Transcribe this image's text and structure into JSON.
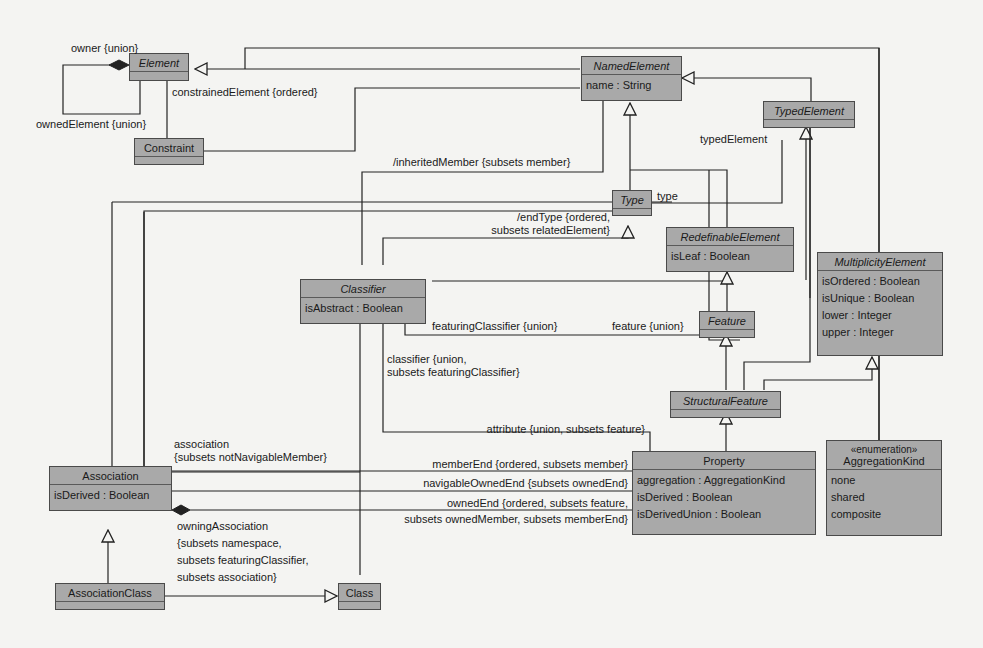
{
  "diagram": {
    "classes": {
      "element": {
        "name": "Element",
        "abstract": true
      },
      "constraint": {
        "name": "Constraint"
      },
      "named_element": {
        "name": "NamedElement",
        "abstract": true,
        "attributes": [
          "name : String"
        ]
      },
      "typed_element": {
        "name": "TypedElement",
        "abstract": true
      },
      "type": {
        "name": "Type",
        "abstract": true
      },
      "redefinable_element": {
        "name": "RedefinableElement",
        "abstract": true,
        "attributes": [
          "isLeaf : Boolean"
        ]
      },
      "multiplicity_element": {
        "name": "MultiplicityElement",
        "abstract": true,
        "attributes": [
          "isOrdered : Boolean",
          "isUnique : Boolean",
          "lower : Integer",
          "upper : Integer"
        ]
      },
      "classifier": {
        "name": "Classifier",
        "abstract": true,
        "attributes": [
          "isAbstract : Boolean"
        ]
      },
      "feature": {
        "name": "Feature",
        "abstract": true
      },
      "structural_feature": {
        "name": "StructuralFeature",
        "abstract": true
      },
      "association": {
        "name": "Association",
        "attributes": [
          "isDerived : Boolean"
        ]
      },
      "property": {
        "name": "Property",
        "attributes": [
          "aggregation : AggregationKind",
          "isDerived : Boolean",
          "isDerivedUnion : Boolean"
        ]
      },
      "aggregation_kind": {
        "stereotype": "«enumeration»",
        "name": "AggregationKind",
        "literals": [
          "none",
          "shared",
          "composite"
        ]
      },
      "association_class": {
        "name": "AssociationClass"
      },
      "class": {
        "name": "Class"
      }
    },
    "labels": {
      "owner": "owner {union}",
      "owned_element": "ownedElement {union}",
      "constrained_element": "constrainedElement {ordered}",
      "inherited_member": "/inheritedMember {subsets member}",
      "typed_element": "typedElement",
      "type": "type",
      "end_type_1": "/endType {ordered,",
      "end_type_2": "subsets relatedElement}",
      "featuring_classifier": "featuringClassifier {union}",
      "feature": "feature {union}",
      "classifier_1": "classifier {union,",
      "classifier_2": "subsets featuringClassifier}",
      "attribute": "attribute {union, subsets feature}",
      "association_1": "association",
      "association_2": "{subsets notNavigableMember}",
      "member_end": "memberEnd {ordered, subsets member}",
      "navigable_owned_end": "navigableOwnedEnd {subsets ownedEnd}",
      "owned_end_1": "ownedEnd {ordered, subsets feature,",
      "owned_end_2": "subsets ownedMember, subsets memberEnd}",
      "owning_association_1": "owningAssociation",
      "owning_association_2": "{subsets namespace,",
      "owning_association_3": "subsets featuringClassifier,",
      "owning_association_4": "subsets association}"
    },
    "colors": {
      "class_fill": "#a9a9a9",
      "line": "#222222",
      "background": "#f4f4f2"
    }
  }
}
